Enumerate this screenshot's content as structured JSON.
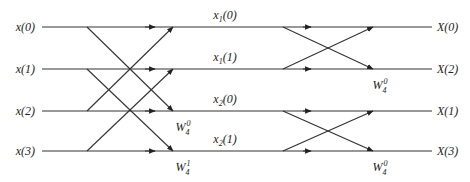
{
  "diagram": {
    "type": "radix-2 DIT FFT butterfly (N=4)",
    "inputs": [
      {
        "base": "x",
        "arg": "(0)"
      },
      {
        "base": "x",
        "arg": "(1)"
      },
      {
        "base": "x",
        "arg": "(2)"
      },
      {
        "base": "x",
        "arg": "(3)"
      }
    ],
    "intermediate": [
      {
        "base": "x",
        "sub": "1",
        "arg": "(0)"
      },
      {
        "base": "x",
        "sub": "1",
        "arg": "(1)"
      },
      {
        "base": "x",
        "sub": "2",
        "arg": "(0)"
      },
      {
        "base": "x",
        "sub": "2",
        "arg": "(1)"
      }
    ],
    "outputs": [
      {
        "base": "X",
        "arg": "(0)"
      },
      {
        "base": "X",
        "arg": "(2)"
      },
      {
        "base": "X",
        "arg": "(1)"
      },
      {
        "base": "X",
        "arg": "(3)"
      }
    ],
    "stage1_twiddles": [
      {
        "row": 2,
        "base": "W",
        "sub": "4",
        "sup": "0"
      },
      {
        "row": 3,
        "base": "W",
        "sub": "4",
        "sup": "1"
      }
    ],
    "stage2_twiddles": [
      {
        "row": 1,
        "base": "W",
        "sub": "4",
        "sup": "0"
      },
      {
        "row": 3,
        "base": "W",
        "sub": "4",
        "sup": "0"
      }
    ],
    "stage1_connections": [
      [
        0,
        0
      ],
      [
        0,
        2
      ],
      [
        2,
        0
      ],
      [
        2,
        2
      ],
      [
        1,
        1
      ],
      [
        1,
        3
      ],
      [
        3,
        1
      ],
      [
        3,
        3
      ]
    ],
    "stage2_connections": [
      [
        0,
        0
      ],
      [
        0,
        1
      ],
      [
        1,
        0
      ],
      [
        1,
        1
      ],
      [
        2,
        2
      ],
      [
        2,
        3
      ],
      [
        3,
        2
      ],
      [
        3,
        3
      ]
    ]
  }
}
